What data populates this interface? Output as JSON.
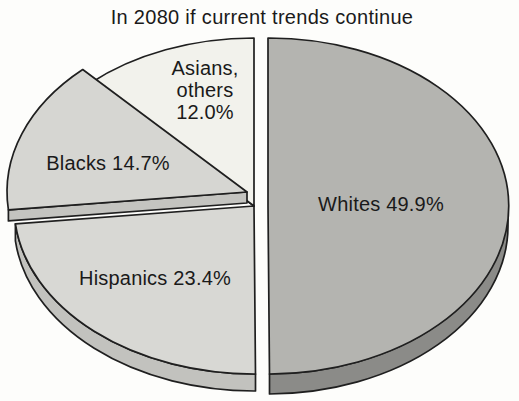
{
  "chart_data": {
    "type": "pie",
    "title": "In 2080 if current trends continue",
    "unit": "percent",
    "style": "3d-exploded-pie",
    "legend": "none",
    "label_placement": "inside-slices",
    "background_color": "#fdfdfb",
    "outline_color": "#1f1f1f",
    "slices": [
      {
        "label": "Whites",
        "value": 49.9,
        "display": "Whites 49.9%",
        "color_top": "#b4b4b0",
        "color_side": "#8b8b88",
        "exploded": true
      },
      {
        "label": "Hispanics",
        "value": 23.4,
        "display": "Hispanics 23.4%",
        "color_top": "#d8d8d4",
        "color_side": "#c2c2be",
        "exploded": false
      },
      {
        "label": "Blacks",
        "value": 14.7,
        "display": "Blacks 14.7%",
        "color_top": "#d6d6d2",
        "color_side": "#c4c4c0",
        "exploded": true
      },
      {
        "label": "Asians, others",
        "value": 12.0,
        "display_lines": [
          "Asians,",
          "others",
          "12.0%"
        ],
        "color_top": "#f2f2ec",
        "color_side": "#e0e0d8",
        "exploded": false
      }
    ]
  }
}
